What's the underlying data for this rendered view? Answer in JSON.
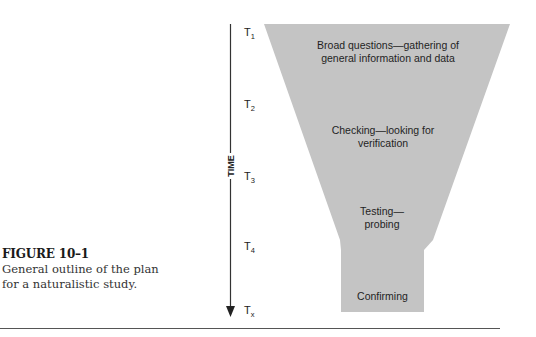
{
  "figure": {
    "title": "FIGURE 10–1",
    "caption": "General outline of the plan for a naturalistic study."
  },
  "timeline": {
    "axis_label": "TIME",
    "markers": [
      {
        "base": "T",
        "sub": "1"
      },
      {
        "base": "T",
        "sub": "2"
      },
      {
        "base": "T",
        "sub": "3"
      },
      {
        "base": "T",
        "sub": "4"
      },
      {
        "base": "T",
        "sub": "x"
      }
    ]
  },
  "funnel": {
    "fill_color": "#c4c4c4",
    "stages": [
      {
        "label": "Broad questions—gathering of general information and data"
      },
      {
        "label": "Checking—looking for verification"
      },
      {
        "label": "Testing—probing"
      },
      {
        "label": "Confirming"
      }
    ]
  }
}
